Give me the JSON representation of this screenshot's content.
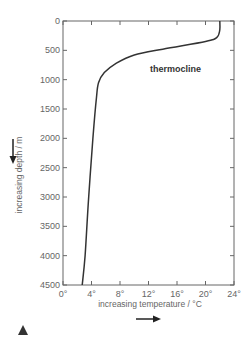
{
  "chart_data": {
    "type": "line",
    "title": "",
    "xlabel": "increasing temperature / °C",
    "ylabel": "increasing depth / m",
    "xlim": [
      0,
      24
    ],
    "ylim": [
      4500,
      0
    ],
    "x_ticks": [
      "0°",
      "4°",
      "8°",
      "12°",
      "16°",
      "20°",
      "24°"
    ],
    "y_ticks": [
      "0",
      "500",
      "1000",
      "1500",
      "2000",
      "2500",
      "3000",
      "3500",
      "4000",
      "4500"
    ],
    "grid": false,
    "series": [
      {
        "name": "temperature profile",
        "points": [
          {
            "temp": 22.0,
            "depth": 0
          },
          {
            "temp": 22.0,
            "depth": 150
          },
          {
            "temp": 21.6,
            "depth": 280
          },
          {
            "temp": 20.0,
            "depth": 350
          },
          {
            "temp": 14.0,
            "depth": 480
          },
          {
            "temp": 10.0,
            "depth": 580
          },
          {
            "temp": 7.5,
            "depth": 720
          },
          {
            "temp": 5.8,
            "depth": 880
          },
          {
            "temp": 5.0,
            "depth": 1050
          },
          {
            "temp": 4.7,
            "depth": 1300
          },
          {
            "temp": 4.2,
            "depth": 2000
          },
          {
            "temp": 3.6,
            "depth": 3000
          },
          {
            "temp": 3.1,
            "depth": 4000
          },
          {
            "temp": 2.7,
            "depth": 4500
          }
        ]
      }
    ],
    "annotations": [
      {
        "text": "thermocline",
        "temp": 12.5,
        "depth": 820
      }
    ]
  },
  "labels": {
    "thermocline": "thermocline",
    "xlabel": "increasing temperature / °C",
    "ylabel": "increasing depth / m"
  },
  "icons": {
    "triangle_marker": "▲"
  }
}
